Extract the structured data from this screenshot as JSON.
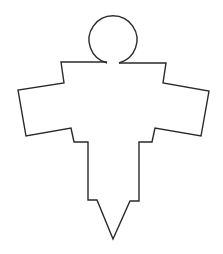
{
  "figure": {
    "stroke_color": "#2a2a2a",
    "background_color": "#ffffff",
    "stroke_width": 1.4
  },
  "head": {
    "cx": 113,
    "cy": 40,
    "r": 24,
    "gap_left": [
      107,
      63
    ],
    "gap_right": [
      119,
      63
    ]
  },
  "body_outline": {
    "points": [
      [
        107,
        62
      ],
      [
        61,
        62
      ],
      [
        64,
        83
      ],
      [
        18,
        90
      ],
      [
        26,
        136
      ],
      [
        71,
        128
      ],
      [
        74,
        142
      ],
      [
        88,
        142
      ],
      [
        88,
        200
      ],
      [
        97,
        200
      ],
      [
        113,
        239
      ],
      [
        130,
        201
      ],
      [
        139,
        201
      ],
      [
        139,
        142
      ],
      [
        152,
        142
      ],
      [
        155,
        128
      ],
      [
        201,
        136
      ],
      [
        209,
        91
      ],
      [
        163,
        83
      ],
      [
        166,
        63
      ],
      [
        119,
        63
      ]
    ]
  }
}
